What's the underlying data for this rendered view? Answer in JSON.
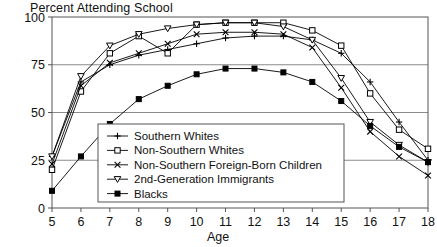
{
  "chart_data": {
    "type": "line",
    "title": "Percent Attending School",
    "xlabel": "Age",
    "ylabel": "",
    "xlim": [
      5,
      18
    ],
    "ylim": [
      0,
      100
    ],
    "grid": true,
    "grid_axis": "y",
    "legend_position": "inside-bottom-left",
    "x": [
      5,
      6,
      7,
      8,
      9,
      10,
      11,
      12,
      13,
      14,
      15,
      16,
      17,
      18
    ],
    "xticks": [
      "5",
      "6",
      "7",
      "8",
      "9",
      "10",
      "11",
      "12",
      "13",
      "14",
      "15",
      "16",
      "17",
      "18"
    ],
    "yticks": [
      "0",
      "25",
      "50",
      "75",
      "100"
    ],
    "series": [
      {
        "name": "Southern Whites",
        "marker": "plus",
        "values": [
          27,
          66,
          75,
          80,
          83,
          86,
          89,
          90,
          90,
          88,
          81,
          66,
          45,
          25
        ]
      },
      {
        "name": "Non-Southern Whites",
        "marker": "open-square",
        "values": [
          20,
          61,
          81,
          90,
          81,
          96,
          97,
          97,
          97,
          93,
          85,
          60,
          41,
          31
        ]
      },
      {
        "name": "Non-Southern Foreign-Born Children",
        "marker": "cross",
        "values": [
          23,
          64,
          76,
          81,
          86,
          91,
          92,
          92,
          91,
          84,
          63,
          40,
          27,
          17
        ]
      },
      {
        "name": "2nd-Generation Immigrants",
        "marker": "open-triangle-down",
        "values": [
          27,
          69,
          85,
          91,
          94,
          96,
          97,
          97,
          95,
          88,
          68,
          45,
          33,
          24
        ]
      },
      {
        "name": "Blacks",
        "marker": "filled-square",
        "values": [
          9,
          27,
          44,
          57,
          64,
          70,
          73,
          73,
          71,
          66,
          56,
          43,
          32,
          24
        ]
      }
    ]
  }
}
